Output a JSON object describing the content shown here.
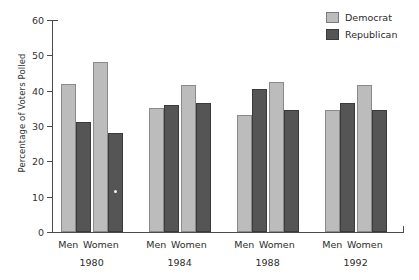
{
  "chart_data": {
    "type": "bar",
    "title": "",
    "xlabel": "",
    "ylabel": "Percentage of Voters Polled",
    "ylim": [
      0,
      60
    ],
    "yticks": [
      0,
      10,
      20,
      30,
      40,
      50,
      60
    ],
    "grid": false,
    "legend_position": "top-right",
    "groups": [
      "1980",
      "1984",
      "1988",
      "1992"
    ],
    "categories": [
      "Men 1980",
      "Women 1980",
      "Men 1984",
      "Women 1984",
      "Men 1988",
      "Women 1988",
      "Men 1992",
      "Women 1992"
    ],
    "subcategories": [
      "Men",
      "Women"
    ],
    "series": [
      {
        "name": "Democrat",
        "color": "#bcbcbc",
        "values": [
          42,
          48,
          35,
          41.5,
          33,
          42.5,
          34.5,
          41.5
        ]
      },
      {
        "name": "Republican",
        "color": "#555555",
        "values": [
          31,
          28,
          36,
          36.5,
          40.5,
          34.5,
          36.5,
          34.5
        ]
      }
    ],
    "annotations": [
      {
        "label": "white-speck-artifact",
        "group": "1980",
        "subcategory": "Women",
        "series": "Republican",
        "value": 12
      }
    ]
  },
  "legend": {
    "items": [
      {
        "label": "Democrat",
        "color": "#bcbcbc"
      },
      {
        "label": "Republican",
        "color": "#555555"
      }
    ]
  },
  "axis": {
    "y_title": "Percentage of Voters Polled",
    "y_tick_labels": [
      "0",
      "10",
      "20",
      "30",
      "40",
      "50",
      "60"
    ]
  }
}
